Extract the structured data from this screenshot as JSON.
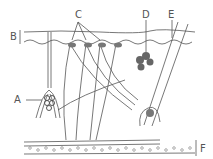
{
  "diagram": {
    "type": "anatomical-cross-section",
    "labels": [
      {
        "id": "A",
        "text": "A",
        "points_to": "coiled gland structure (left)"
      },
      {
        "id": "B",
        "text": "B",
        "points_to": "epidermis layer (bracket)"
      },
      {
        "id": "C",
        "text": "C",
        "points_to": "receptor endings below epidermis"
      },
      {
        "id": "D",
        "text": "D",
        "points_to": "lobed gland beside hair shaft"
      },
      {
        "id": "E",
        "text": "E",
        "points_to": "hair shaft"
      },
      {
        "id": "F",
        "text": "F",
        "points_to": "subcutaneous fat layer (bracket)"
      }
    ],
    "colors": {
      "line": "#555555",
      "gland_fill": "#777777",
      "background": "#ffffff"
    }
  }
}
